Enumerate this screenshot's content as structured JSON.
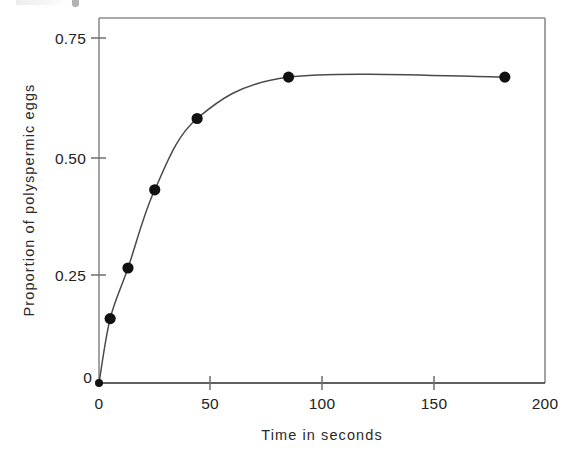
{
  "figure": {
    "background_color": "#ffffff",
    "frame_color": "#8d8d8d",
    "axis_color": "#2b2b2b",
    "marker_color": "#111111",
    "line_color": "#4a4a4a"
  },
  "chart_data": {
    "type": "line",
    "title": "",
    "subtitle": "",
    "xlabel": "Time in seconds",
    "ylabel": "Proportion of polyspermic eggs",
    "xlim": [
      0,
      200
    ],
    "ylim": [
      0,
      0.82
    ],
    "xticks": [
      0,
      50,
      100,
      150,
      200
    ],
    "xticklabels": [
      "0",
      "50",
      "100",
      "150",
      "200"
    ],
    "yticks": [
      0,
      0.25,
      0.5,
      0.75
    ],
    "yticklabels": [
      "0",
      "0.25",
      "0.50",
      "0.75"
    ],
    "grid": false,
    "legend": null,
    "marker": "filled-circle",
    "series": [
      {
        "name": "Proportion of polyspermic eggs",
        "x": [
          0,
          5,
          13,
          25,
          44,
          85,
          182
        ],
        "values": [
          0.0,
          0.14,
          0.25,
          0.42,
          0.575,
          0.665,
          0.665
        ]
      }
    ],
    "annotations": []
  },
  "axes": {
    "y_axis_title": "Proportion of polyspermic eggs",
    "x_axis_title": "Time in seconds",
    "y_tick_0": "0",
    "y_tick_1": "0.25",
    "y_tick_2": "0.50",
    "y_tick_3": "0.75",
    "x_tick_0": "0",
    "x_tick_1": "50",
    "x_tick_2": "100",
    "x_tick_3": "150",
    "x_tick_4": "200"
  }
}
